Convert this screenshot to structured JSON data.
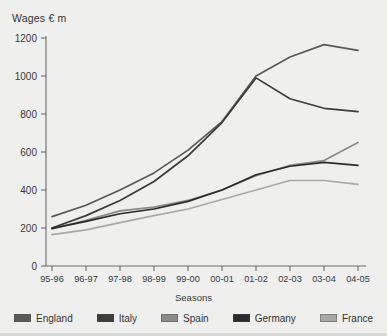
{
  "chart_data": {
    "type": "line",
    "title": "",
    "ylabel": "Wages € m",
    "xlabel": "Seasons",
    "categories": [
      "95-96",
      "96-97",
      "97-98",
      "98-99",
      "99-00",
      "00-01",
      "01-02",
      "02-03",
      "03-04",
      "04-05"
    ],
    "yticks": [
      0,
      200,
      400,
      600,
      800,
      1000,
      1200
    ],
    "ylim": [
      0,
      1260
    ],
    "grid": false,
    "legend_position": "bottom",
    "series": [
      {
        "name": "England",
        "color": "#5a5a5a",
        "values": [
          260,
          320,
          400,
          490,
          610,
          760,
          1000,
          1100,
          1165,
          1135
        ]
      },
      {
        "name": "Italy",
        "color": "#3c3c3c",
        "values": [
          200,
          265,
          345,
          445,
          580,
          755,
          990,
          880,
          830,
          812
        ]
      },
      {
        "name": "Spain",
        "color": "#8a8a8a",
        "values": [
          195,
          240,
          290,
          310,
          345,
          400,
          475,
          530,
          555,
          650
        ]
      },
      {
        "name": "Germany",
        "color": "#2b2b2b",
        "values": [
          198,
          235,
          275,
          300,
          340,
          400,
          480,
          525,
          545,
          530
        ]
      },
      {
        "name": "France",
        "color": "#a8a8a8",
        "values": [
          165,
          190,
          228,
          265,
          300,
          350,
          400,
          450,
          450,
          430
        ]
      }
    ]
  },
  "axis": {
    "ylabel": "Wages € m",
    "xlabel": "Seasons",
    "ytick_labels": [
      "1200",
      "1000",
      "800",
      "600",
      "400",
      "200",
      "0"
    ],
    "xtick_labels": [
      "95-96",
      "96-97",
      "97-98",
      "98-99",
      "99-00",
      "00-01",
      "01-02",
      "02-03",
      "03-04",
      "04-05"
    ]
  },
  "legend": {
    "items": [
      {
        "label": "England",
        "color": "#5a5a5a"
      },
      {
        "label": "Italy",
        "color": "#3c3c3c"
      },
      {
        "label": "Spain",
        "color": "#8a8a8a"
      },
      {
        "label": "Germany",
        "color": "#2b2b2b"
      },
      {
        "label": "France",
        "color": "#a8a8a8"
      }
    ]
  },
  "colors": {
    "background": "#efefee",
    "axis": "#6b6b6b",
    "text": "#333333"
  }
}
